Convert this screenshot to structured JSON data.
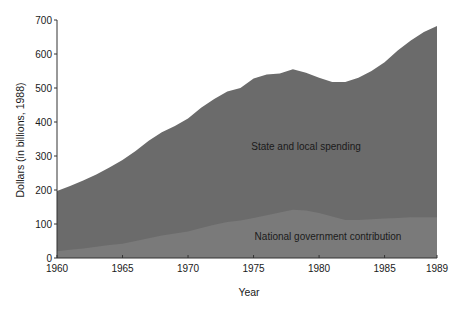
{
  "chart_data": {
    "type": "area",
    "stacked": true,
    "title": "",
    "xlabel": "Year",
    "ylabel": "Dollars (in billions, 1988)",
    "xlim": [
      1960,
      1989
    ],
    "ylim": [
      0,
      700
    ],
    "x_ticks": [
      "1960",
      "1965",
      "1970",
      "1975",
      "1980",
      "1985",
      "1989"
    ],
    "y_ticks": [
      "0",
      "100",
      "200",
      "300",
      "400",
      "500",
      "600",
      "700"
    ],
    "grid": false,
    "legend": "none (inline labels)",
    "x": [
      1960,
      1961,
      1962,
      1963,
      1964,
      1965,
      1966,
      1967,
      1968,
      1969,
      1970,
      1971,
      1972,
      1973,
      1974,
      1975,
      1976,
      1977,
      1978,
      1979,
      1980,
      1981,
      1982,
      1983,
      1984,
      1985,
      1986,
      1987,
      1988,
      1989
    ],
    "series": [
      {
        "name": "National government contribution",
        "values": [
          20,
          24,
          28,
          33,
          38,
          42,
          50,
          58,
          66,
          72,
          78,
          88,
          98,
          106,
          110,
          118,
          126,
          134,
          142,
          140,
          132,
          122,
          112,
          112,
          114,
          116,
          118,
          120,
          120,
          120
        ]
      },
      {
        "name": "Total (national + state and local spending)",
        "values": [
          197,
          212,
          228,
          246,
          266,
          288,
          315,
          345,
          370,
          388,
          410,
          442,
          468,
          490,
          500,
          528,
          540,
          543,
          555,
          545,
          530,
          518,
          518,
          530,
          550,
          576,
          610,
          640,
          665,
          682
        ]
      }
    ],
    "annotations": [
      {
        "text": "State and local spending",
        "x": 1978.5,
        "y": 330
      },
      {
        "text": "National government contribution",
        "x": 1981,
        "y": 65
      }
    ],
    "colors": {
      "total_area": "#6b6b6b",
      "national_area": "#7a7a7a",
      "axis": "#333333"
    }
  },
  "labels": {
    "ylabel": "Dollars (in billions, 1988)",
    "xlabel": "Year",
    "state_local": "State and local spending",
    "national": "National government contribution"
  }
}
